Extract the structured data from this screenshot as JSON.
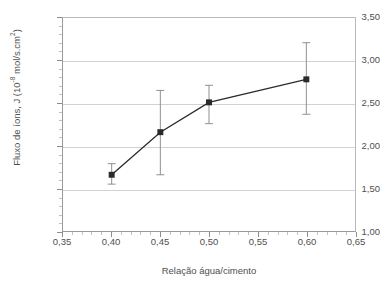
{
  "figure": {
    "clipped_title": "",
    "background_color": "#ffffff",
    "grid_color": "#d2d2d2",
    "axis_color": "#8d8d8d",
    "series_color": "#2b2b2b"
  },
  "chart_data": {
    "type": "line",
    "title": "",
    "xlabel": "Relação água/cimento",
    "ylabel": "Fluxo de íons, J (10-8 mol/s.cm2)",
    "ylabel_base": "Fluxo de íons, J (10",
    "ylabel_exponent": "-8",
    "ylabel_tail": " mol/s.cm",
    "ylabel_tail_exponent": "2",
    "ylabel_close": ")",
    "xlim": [
      0.35,
      0.65
    ],
    "ylim": [
      1.0,
      3.5
    ],
    "grid": true,
    "grid_axis": "y",
    "legend": "none",
    "marker": "square",
    "error_bars": true,
    "x": [
      0.4,
      0.45,
      0.5,
      0.6
    ],
    "y": [
      1.66,
      2.16,
      2.51,
      2.78
    ],
    "yerr_low": [
      0.11,
      0.5,
      0.25,
      0.41
    ],
    "yerr_high": [
      0.13,
      0.49,
      0.2,
      0.43
    ],
    "points": [
      {
        "x": 0.4,
        "y": 1.66,
        "low": 1.55,
        "high": 1.79
      },
      {
        "x": 0.45,
        "y": 2.16,
        "low": 1.66,
        "high": 2.65
      },
      {
        "x": 0.5,
        "y": 2.51,
        "low": 2.26,
        "high": 2.71
      },
      {
        "x": 0.6,
        "y": 2.78,
        "low": 2.37,
        "high": 3.21
      }
    ],
    "xticks": [
      0.35,
      0.4,
      0.45,
      0.5,
      0.55,
      0.6,
      0.65
    ],
    "xtick_labels": [
      "0,35",
      "0,40",
      "0,45",
      "0,50",
      "0,55",
      "0,60",
      "0,65"
    ],
    "yticks": [
      1.0,
      1.5,
      2.0,
      2.5,
      3.0,
      3.5
    ],
    "ytick_labels": [
      "1,00",
      "1,50",
      "2,00",
      "2,50",
      "3,00",
      "3,50"
    ]
  }
}
